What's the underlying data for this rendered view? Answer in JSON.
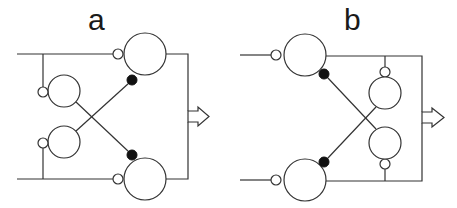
{
  "panels": [
    {
      "id": "a",
      "label": "a",
      "description": "Left-to-right network: two input lines feed large output neurons via excitatory (open) synapses; two interneurons receive excitation from the inputs and cross-inhibit (filled) the opposite output neuron; outputs merge into an output arrow."
    },
    {
      "id": "b",
      "label": "b",
      "description": "Input lines feed large neurons via excitatory (open) synapses; output neuron lines feed interneurons which cross-inhibit (filled) the opposite large neuron; outputs merge into an output arrow."
    }
  ],
  "legend": {
    "open_circle_small": "excitatory synapse",
    "filled_circle_small": "inhibitory synapse",
    "large_circle": "neuron",
    "arrow": "output"
  },
  "colors": {
    "stroke": "#333333",
    "fill_inhibitory": "#111111",
    "background": "#ffffff"
  }
}
